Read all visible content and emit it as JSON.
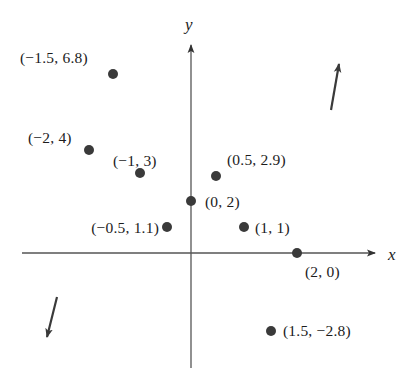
{
  "figure": {
    "width": 416,
    "height": 368,
    "background": "#ffffff",
    "ink_color": "#1c1c1c",
    "dot_color": "#3a3a3a",
    "axis_color": "#555555"
  },
  "axes": {
    "x_label": "x",
    "y_label": "y",
    "origin_px": {
      "x": 191,
      "y": 253
    },
    "x_axis_px": {
      "x1": 22,
      "y1": 253,
      "x2": 375,
      "y2": 253
    },
    "y_axis_px": {
      "x1": 191,
      "y1": 45,
      "x2": 191,
      "y2": 368
    },
    "x_label_px": {
      "x": 388,
      "y": 255
    },
    "y_label_px": {
      "x": 185,
      "y": 25
    },
    "ticks": [],
    "grid": false
  },
  "annotations": {
    "arrow_up_right": {
      "name": "trend-up-arrow",
      "from_px": {
        "x": 331,
        "y": 110
      },
      "to_px": {
        "x": 339,
        "y": 64
      }
    },
    "arrow_down_left": {
      "name": "trend-down-arrow",
      "from_px": {
        "x": 57,
        "y": 297
      },
      "to_px": {
        "x": 47,
        "y": 337
      }
    }
  },
  "chart_data": {
    "type": "scatter",
    "title": "",
    "subtitle": "",
    "xlabel": "x",
    "ylabel": "y",
    "grid": false,
    "legend": null,
    "xlim": [
      -2.6,
      2.8
    ],
    "ylim": [
      -3.6,
      7.8
    ],
    "points": [
      {
        "x": -1.5,
        "y": 6.8,
        "label": "(−1.5, 6.8)",
        "dot_px": {
          "x": 113,
          "y": 74
        },
        "label_px": {
          "x": 20,
          "y": 58
        },
        "label_anchor": "left"
      },
      {
        "x": -2,
        "y": 4,
        "label": "(−2, 4)",
        "dot_px": {
          "x": 89,
          "y": 150
        },
        "label_px": {
          "x": 28,
          "y": 138
        },
        "label_anchor": "left"
      },
      {
        "x": -1,
        "y": 3,
        "label": "(−1, 3)",
        "dot_px": {
          "x": 140,
          "y": 173
        },
        "label_px": {
          "x": 113,
          "y": 161
        },
        "label_anchor": "left"
      },
      {
        "x": 0.5,
        "y": 2.9,
        "label": "(0.5, 2.9)",
        "dot_px": {
          "x": 216,
          "y": 176
        },
        "label_px": {
          "x": 227,
          "y": 160
        },
        "label_anchor": "left"
      },
      {
        "x": 0,
        "y": 2,
        "label": "(0, 2)",
        "dot_px": {
          "x": 191,
          "y": 201
        },
        "label_px": {
          "x": 205,
          "y": 202
        },
        "label_anchor": "left"
      },
      {
        "x": -0.5,
        "y": 1.1,
        "label": "(−0.5, 1.1)",
        "dot_px": {
          "x": 167,
          "y": 227
        },
        "label_px": {
          "x": 159,
          "y": 228
        },
        "label_anchor": "right"
      },
      {
        "x": 1,
        "y": 1,
        "label": "(1, 1)",
        "dot_px": {
          "x": 244,
          "y": 227
        },
        "label_px": {
          "x": 255,
          "y": 228
        },
        "label_anchor": "left"
      },
      {
        "x": 2,
        "y": 0,
        "label": "(2, 0)",
        "dot_px": {
          "x": 297,
          "y": 253
        },
        "label_px": {
          "x": 305,
          "y": 272
        },
        "label_anchor": "left"
      },
      {
        "x": 1.5,
        "y": -2.8,
        "label": "(1.5, −2.8)",
        "dot_px": {
          "x": 271,
          "y": 331
        },
        "label_px": {
          "x": 283,
          "y": 331
        },
        "label_anchor": "left"
      }
    ]
  }
}
